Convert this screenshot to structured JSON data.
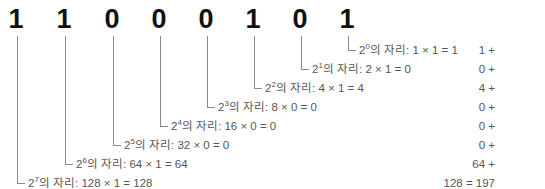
{
  "binary_number": {
    "digits": [
      "1",
      "1",
      "0",
      "0",
      "0",
      "1",
      "0",
      "1"
    ]
  },
  "place_values": [
    {
      "power": "0",
      "suffix": "의 자리: 1 × 1 = 1",
      "sum_term": "1 +"
    },
    {
      "power": "1",
      "suffix": "의 자리: 2 × 1 = 0",
      "sum_term": "0 +"
    },
    {
      "power": "2",
      "suffix": "의 자리: 4 × 1 = 4",
      "sum_term": "4 +"
    },
    {
      "power": "3",
      "suffix": "의 자리: 8 × 0 = 0",
      "sum_term": "0 +"
    },
    {
      "power": "4",
      "suffix": "의 자리: 16 × 0 = 0",
      "sum_term": "0 +"
    },
    {
      "power": "5",
      "suffix": "의 자리: 32 × 0 = 0",
      "sum_term": "0 +"
    },
    {
      "power": "6",
      "suffix": "의 자리: 64 × 1 = 64",
      "sum_term": "64 +"
    },
    {
      "power": "7",
      "suffix": "의 자리: 128 × 1 = 128",
      "sum_term": "128 = 197"
    }
  ],
  "base_label": "2",
  "colors": {
    "digit": "#111111",
    "text": "#555555",
    "line": "#8a8a8a"
  }
}
